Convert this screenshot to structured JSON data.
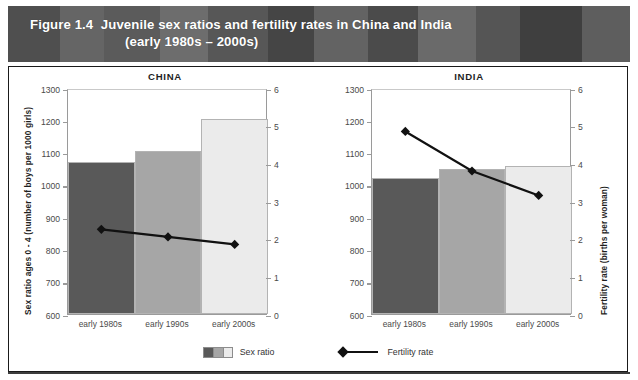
{
  "header": {
    "figure_number": "Figure 1.4",
    "title_line1": "Juvenile sex ratios and fertility rates in China and India",
    "title_line2": "(early 1980s – 2000s)",
    "background_color": "#5a5a5a",
    "text_color": "#ffffff"
  },
  "axes": {
    "left_title": "Sex ratio ages 0 - 4 (number of boys per 1000 girls)",
    "right_title": "Fertility rate (births per woman)",
    "left_ticks": [
      "600",
      "700",
      "800",
      "900",
      "1000",
      "1100",
      "1200",
      "1300"
    ],
    "right_ticks": [
      "0",
      "1",
      "2",
      "3",
      "4",
      "5",
      "6"
    ]
  },
  "legend": {
    "bar_label": "Sex ratio",
    "line_label": "Fertility rate",
    "swatch_colors": [
      "#595959",
      "#a6a6a6",
      "#ebebeb"
    ],
    "line_color": "#111111"
  },
  "panels": [
    {
      "name": "CHINA",
      "key": "china"
    },
    {
      "name": "INDIA",
      "key": "india"
    }
  ],
  "chart_data": {
    "type": "bar",
    "title": "Figure 1.4  Juvenile sex ratios and fertility rates in China and India (early 1980s – 2000s)",
    "xlabel": "",
    "ylabel": "Sex ratio ages 0 - 4 (number of boys per 1000 girls)",
    "y2label": "Fertility rate (births per woman)",
    "ylim": [
      600,
      1300
    ],
    "y2lim": [
      0,
      6
    ],
    "ytick_step": 100,
    "y2tick_step": 1,
    "grid": false,
    "legend_position": "bottom-center",
    "categories": [
      "early 1980s",
      "early 1990s",
      "early 2000s"
    ],
    "bar_colors": [
      "#595959",
      "#a6a6a6",
      "#ebebeb"
    ],
    "panels": [
      {
        "name": "CHINA",
        "series": [
          {
            "name": "Sex ratio",
            "type": "bar",
            "axis": "left",
            "values": [
              1070,
              1105,
              1205
            ]
          },
          {
            "name": "Fertility rate",
            "type": "line",
            "axis": "right",
            "values": [
              2.3,
              2.1,
              1.9
            ]
          }
        ]
      },
      {
        "name": "INDIA",
        "series": [
          {
            "name": "Sex ratio",
            "type": "bar",
            "axis": "left",
            "values": [
              1020,
              1048,
              1057
            ]
          },
          {
            "name": "Fertility rate",
            "type": "line",
            "axis": "right",
            "values": [
              4.9,
              3.85,
              3.2
            ]
          }
        ]
      }
    ]
  }
}
